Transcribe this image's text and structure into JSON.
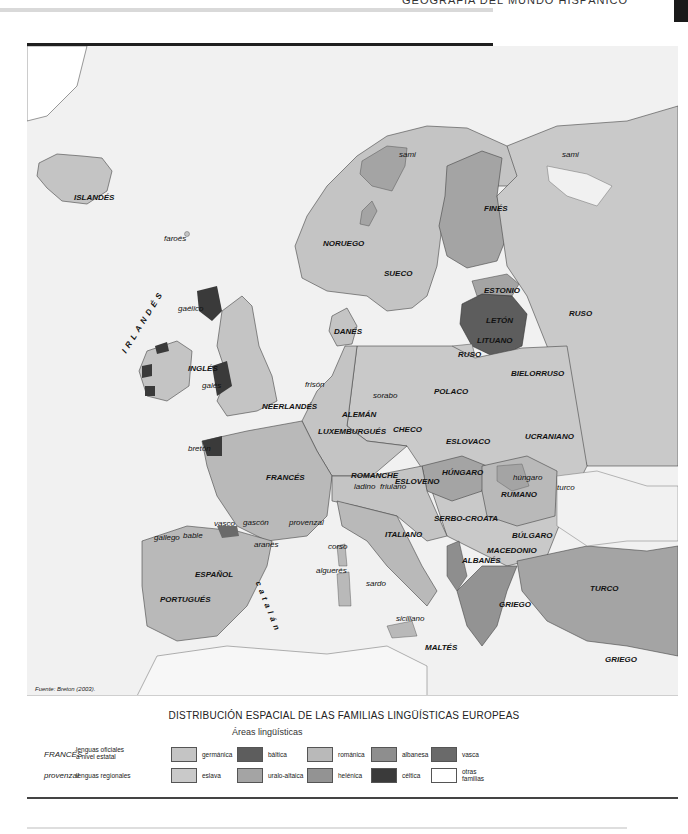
{
  "header": {
    "title": "GEOGRAFÍA DEL MUNDO HISPÁNICO"
  },
  "map": {
    "source": "Fuente: Breton (2003).",
    "colors": {
      "sea": "#f1f1f1",
      "germanica": "#c4c4c4",
      "baltica": "#5d5d5d",
      "romanica": "#b9b9b9",
      "albanesa": "#8e8e8e",
      "vasca": "#6a6a6a",
      "eslava": "#c9c9c9",
      "uralo_altaica": "#a4a4a4",
      "helenica": "#939393",
      "celtica": "#3a3a3a",
      "otras": "#ffffff"
    },
    "official_labels": [
      {
        "text": "ISLANDÉS",
        "x": 74,
        "y": 193
      },
      {
        "text": "NORUEGO",
        "x": 323,
        "y": 239
      },
      {
        "text": "SUECO",
        "x": 384,
        "y": 269
      },
      {
        "text": "FINÉS",
        "x": 484,
        "y": 204
      },
      {
        "text": "ESTONIO",
        "x": 484,
        "y": 286
      },
      {
        "text": "LETÓN",
        "x": 486,
        "y": 316
      },
      {
        "text": "LITUANO",
        "x": 477,
        "y": 336
      },
      {
        "text": "RUSO",
        "x": 458,
        "y": 350
      },
      {
        "text": "RUSO",
        "x": 569,
        "y": 309
      },
      {
        "text": "DANÉS",
        "x": 334,
        "y": 327
      },
      {
        "text": "INGLÉS",
        "x": 188,
        "y": 364
      },
      {
        "text": "NEERLANDÉS",
        "x": 262,
        "y": 402
      },
      {
        "text": "ALEMÁN",
        "x": 342,
        "y": 410
      },
      {
        "text": "LUXEMBURGUÉS",
        "x": 318,
        "y": 427
      },
      {
        "text": "POLACO",
        "x": 434,
        "y": 387
      },
      {
        "text": "BIELORRUSO",
        "x": 511,
        "y": 369
      },
      {
        "text": "CHECO",
        "x": 393,
        "y": 425
      },
      {
        "text": "ESLOVACO",
        "x": 446,
        "y": 437
      },
      {
        "text": "UCRANIANO",
        "x": 525,
        "y": 432
      },
      {
        "text": "FRANCÉS",
        "x": 266,
        "y": 473
      },
      {
        "text": "ROMANCHE",
        "x": 351,
        "y": 471
      },
      {
        "text": "ESLOVENO",
        "x": 395,
        "y": 477
      },
      {
        "text": "HÚNGARO",
        "x": 442,
        "y": 468
      },
      {
        "text": "RUMANO",
        "x": 501,
        "y": 490
      },
      {
        "text": "SERBO-CROATA",
        "x": 434,
        "y": 514
      },
      {
        "text": "BÚLGARO",
        "x": 512,
        "y": 531
      },
      {
        "text": "MACEDONIO",
        "x": 487,
        "y": 546
      },
      {
        "text": "ALBANÉS",
        "x": 462,
        "y": 556
      },
      {
        "text": "ITALIANO",
        "x": 385,
        "y": 530
      },
      {
        "text": "ESPAÑOL",
        "x": 195,
        "y": 570
      },
      {
        "text": "PORTUGUÉS",
        "x": 160,
        "y": 595
      },
      {
        "text": "GRIEGO",
        "x": 499,
        "y": 600
      },
      {
        "text": "TURCO",
        "x": 590,
        "y": 584
      },
      {
        "text": "MALTÉS",
        "x": 425,
        "y": 643
      },
      {
        "text": "GRIEGO",
        "x": 605,
        "y": 655
      }
    ],
    "regional_labels": [
      {
        "text": "sami",
        "x": 399,
        "y": 150
      },
      {
        "text": "sami",
        "x": 562,
        "y": 150
      },
      {
        "text": "faroés",
        "x": 164,
        "y": 234
      },
      {
        "text": "gaélico",
        "x": 178,
        "y": 304
      },
      {
        "text": "galés",
        "x": 202,
        "y": 381
      },
      {
        "text": "frisón",
        "x": 305,
        "y": 380
      },
      {
        "text": "sorabo",
        "x": 373,
        "y": 391
      },
      {
        "text": "bretón",
        "x": 188,
        "y": 444
      },
      {
        "text": "ladino",
        "x": 354,
        "y": 482
      },
      {
        "text": "friulano",
        "x": 380,
        "y": 482
      },
      {
        "text": "húngaro",
        "x": 513,
        "y": 473
      },
      {
        "text": "turco",
        "x": 557,
        "y": 483
      },
      {
        "text": "vasco",
        "x": 214,
        "y": 519
      },
      {
        "text": "gascón",
        "x": 243,
        "y": 518
      },
      {
        "text": "provenzal",
        "x": 289,
        "y": 518
      },
      {
        "text": "gallego",
        "x": 154,
        "y": 533
      },
      {
        "text": "bable",
        "x": 183,
        "y": 531
      },
      {
        "text": "aranés",
        "x": 254,
        "y": 540
      },
      {
        "text": "corso",
        "x": 328,
        "y": 542
      },
      {
        "text": "alguerés",
        "x": 316,
        "y": 566
      },
      {
        "text": "sardo",
        "x": 366,
        "y": 579
      },
      {
        "text": "siciliano",
        "x": 396,
        "y": 614
      }
    ],
    "spaced_labels": [
      {
        "text": "IRLANDÉS",
        "x": 120,
        "y": 350,
        "rotate": -58
      },
      {
        "text": "catalán",
        "x": 262,
        "y": 580,
        "rotate": 68
      }
    ]
  },
  "legend": {
    "title": "DISTRIBUCIÓN ESPACIAL DE LAS FAMILIAS LINGÜÍSTICAS EUROPEAS",
    "subtitle": "Áreas lingüísticas",
    "types": [
      {
        "sample": "FRANCÉS",
        "desc_line1": "lenguas oficiales",
        "desc_line2": "a nivel estatal"
      },
      {
        "sample": "provenzal",
        "desc_line1": "lenguas regionales",
        "desc_line2": ""
      }
    ],
    "areas": [
      {
        "label": "germánica",
        "color": "#c4c4c4"
      },
      {
        "label": "báltica",
        "color": "#5d5d5d"
      },
      {
        "label": "románica",
        "color": "#b9b9b9"
      },
      {
        "label": "albanesa",
        "color": "#8e8e8e"
      },
      {
        "label": "vasca",
        "color": "#6a6a6a"
      },
      {
        "label": "eslava",
        "color": "#c9c9c9"
      },
      {
        "label": "uralo-altaica",
        "color": "#a4a4a4"
      },
      {
        "label": "helénica",
        "color": "#939393"
      },
      {
        "label": "céltica",
        "color": "#3a3a3a"
      },
      {
        "label": "otras",
        "label2": "familias",
        "color": "#ffffff"
      }
    ]
  }
}
